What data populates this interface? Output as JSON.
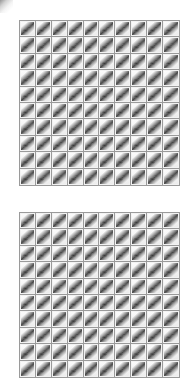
{
  "page": {
    "background_color": "#ffffff",
    "width": 193,
    "height": 385
  },
  "artifact": {
    "name": "corner-smudge",
    "color": "#3c3c3c"
  },
  "thumbnail": {
    "semantic_name": "thumbnail-image",
    "description": "low-resolution grayscale diagonal object thumbnail",
    "cell_background": "#f2f2f2",
    "border_color": "#9a9a9a",
    "ink_color": "#373737"
  },
  "grids": [
    {
      "id": "grid-block-top",
      "label": "Thumbnail Grid 1",
      "rows": 10,
      "columns": 10,
      "cell_count": 100
    },
    {
      "id": "grid-block-bottom",
      "label": "Thumbnail Grid 2",
      "rows": 10,
      "columns": 10,
      "cell_count": 100
    }
  ]
}
